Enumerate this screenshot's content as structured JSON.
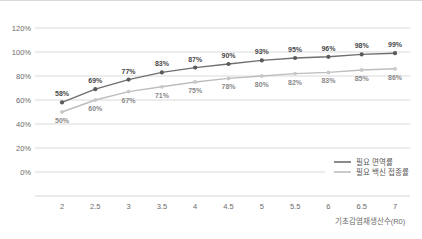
{
  "chart_data": {
    "type": "line",
    "title": "",
    "xlabel": "기초감염재생산수(R0)",
    "ylabel": "",
    "x": [
      2,
      2.5,
      3,
      3.5,
      4,
      4.5,
      5,
      5.5,
      6,
      6.5,
      7
    ],
    "xticklabels": [
      "2",
      "2.5",
      "3",
      "3.5",
      "4",
      "4.5",
      "5",
      "5.5",
      "6",
      "6.5",
      "7"
    ],
    "yticklabels": [
      "0%",
      "20%",
      "40%",
      "60%",
      "80%",
      "100%",
      "120%"
    ],
    "yticks": [
      0,
      20,
      40,
      60,
      80,
      100,
      120
    ],
    "ylim": [
      0,
      120
    ],
    "grid": true,
    "legend_position": "bottom-right",
    "series": [
      {
        "name": "필요 면역률",
        "color": "#6f6f6f",
        "label_position": "above",
        "values": [
          58,
          69,
          77,
          83,
          87,
          90,
          93,
          95,
          96,
          98,
          99
        ],
        "labels": [
          "58%",
          "69%",
          "77%",
          "83%",
          "87%",
          "90%",
          "93%",
          "95%",
          "96%",
          "98%",
          "99%"
        ]
      },
      {
        "name": "필요 백신 접종률",
        "color": "#bdbdbd",
        "label_position": "below",
        "values": [
          50,
          60,
          67,
          71,
          75,
          78,
          80,
          82,
          83,
          85,
          86
        ],
        "labels": [
          "50%",
          "60%",
          "67%",
          "71%",
          "75%",
          "78%",
          "80%",
          "82%",
          "83%",
          "85%",
          "86%"
        ]
      }
    ]
  },
  "legend": {
    "items": [
      {
        "label": "필요 면역률"
      },
      {
        "label": "필요 백신 접종률"
      }
    ]
  },
  "colors": {
    "series_a": "#6f6f6f",
    "series_b": "#bdbdbd",
    "gridline": "#d0d0d0",
    "tick_text": "#6b6b6b",
    "background": "#ffffff"
  }
}
